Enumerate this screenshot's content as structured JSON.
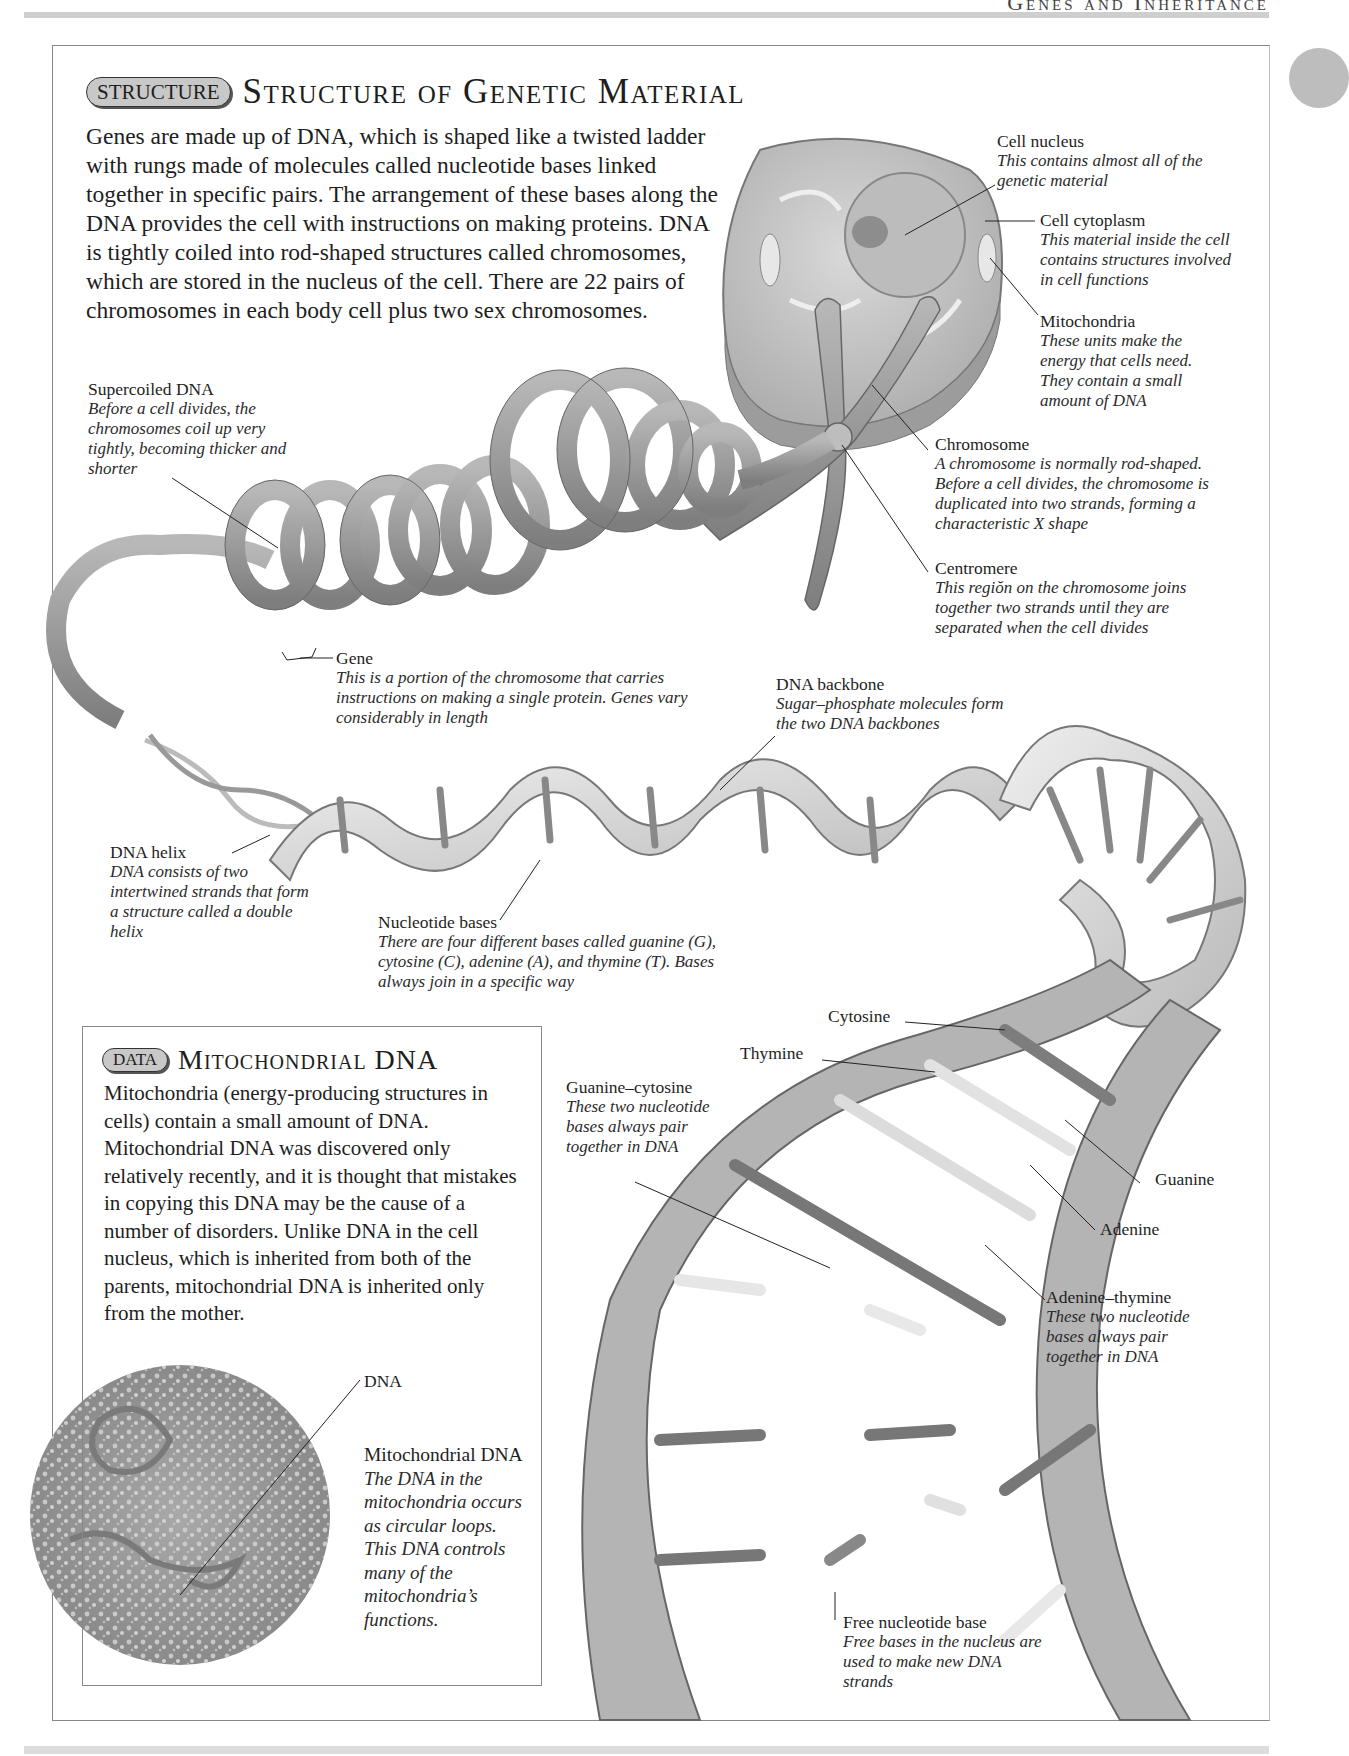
{
  "page": {
    "running_head": "Genes and Inheritance"
  },
  "structure_section": {
    "badge": "STRUCTURE",
    "title": "Structure of Genetic Material",
    "intro": "Genes are made up of DNA, which is shaped like a twisted ladder with rungs made of molecules called nucleotide bases linked together in specific pairs. The arrangement of these bases along the DNA provides the cell with instructions on making proteins. DNA is tightly coiled into rod-shaped structures called chromosomes, which are stored in the nucleus of the cell. There are 22 pairs of chromosomes in each body cell plus two sex chromosomes."
  },
  "callouts": {
    "cell_nucleus": {
      "title": "Cell nucleus",
      "desc": "This contains almost all of the genetic material"
    },
    "cell_cytoplasm": {
      "title": "Cell cytoplasm",
      "desc": "This material inside the cell contains structures involved in cell functions"
    },
    "mitochondria": {
      "title": "Mitochondria",
      "desc": "These units make the energy that cells need. They contain a small amount of DNA"
    },
    "chromosome": {
      "title": "Chromosome",
      "desc": "A chromosome is normally rod-shaped. Before a cell divides, the chromosome is duplicated into two strands, forming a characteristic X shape"
    },
    "centromere": {
      "title": "Centromere",
      "desc": "This regiŏn on the chromosome joins together two strands until they are separated when the cell divides"
    },
    "supercoiled_dna": {
      "title": "Supercoiled DNA",
      "desc": "Before a cell divides, the chromosomes coil up very tightly, becoming thicker and shorter"
    },
    "gene": {
      "title": "Gene",
      "desc": "This is a portion of the chromosome that carries instructions on making a single protein. Genes vary considerably in length"
    },
    "dna_backbone": {
      "title": "DNA backbone",
      "desc": "Sugar–phosphate molecules form the two DNA backbones"
    },
    "dna_helix": {
      "title": "DNA helix",
      "desc": "DNA consists of two intertwined strands that form a structure called a double helix"
    },
    "nucleotide_bases": {
      "title": "Nucleotide bases",
      "desc": "There are four different bases called guanine (G), cytosine (C), adenine (A), and thymine (T). Bases always join in a specific way"
    },
    "cytosine": {
      "title": "Cytosine"
    },
    "thymine": {
      "title": "Thymine"
    },
    "guanine": {
      "title": "Guanine"
    },
    "adenine": {
      "title": "Adenine"
    },
    "guanine_cytosine": {
      "title": "Guanine–cytosine",
      "desc": "These two nucleotide bases always pair together in DNA"
    },
    "adenine_thymine": {
      "title": "Adenine–thymine",
      "desc": "These two nucleotide bases always pair together in DNA"
    },
    "free_base": {
      "title": "Free nucleotide base",
      "desc": "Free bases in the nucleus are used to make new DNA strands"
    }
  },
  "data_section": {
    "badge": "DATA",
    "title": "Mitochondrial DNA",
    "text": "Mitochondria (energy-producing structures in cells) contain a small amount of DNA. Mitochondrial DNA was discovered only relatively recently, and it is thought that mistakes in copying this DNA may be the cause of a number of disorders. Unlike DNA in the cell nucleus, which is inherited from both of the parents, mitochondrial DNA is inherited only from the mother.",
    "micrograph_label": "DNA",
    "micrograph_caption": {
      "title": "Mitochondrial DNA",
      "desc": "The DNA in the mitochondria occurs as circular loops. This DNA controls many of the mitochondria’s functions."
    }
  },
  "colors": {
    "badge_fill": "#c8c8c8",
    "coil": "#9a9a9a",
    "ribbon": "#d6d6d6",
    "backbone_dark": "#9c9c9c",
    "text": "#1e1e1e"
  }
}
